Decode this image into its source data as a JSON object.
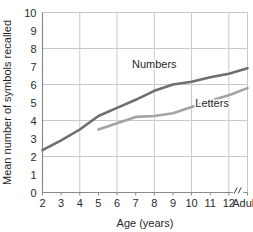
{
  "chart_data": {
    "type": "line",
    "title": "",
    "xlabel": "Age (years)",
    "ylabel": "Mean number of symbols recalled",
    "x_tick_labels": [
      "2",
      "3",
      "4",
      "5",
      "6",
      "7",
      "8",
      "9",
      "10",
      "11",
      "12",
      "Adults"
    ],
    "y_tick_labels": [
      "0",
      "1",
      "2",
      "3",
      "4",
      "5",
      "6",
      "7",
      "8",
      "9",
      "10"
    ],
    "ylim": [
      0,
      10
    ],
    "y_gridlines_at": [
      0,
      2,
      4,
      6,
      8,
      10
    ],
    "x_gridlines_at": [
      "2",
      "4",
      "6",
      "8",
      "10",
      "12",
      "Adults"
    ],
    "grid": true,
    "legend_position": "inline-annotation",
    "axis_break": {
      "symbol": "//",
      "between": [
        "12",
        "Adults"
      ]
    },
    "series": [
      {
        "name": "Numbers",
        "label": "Numbers",
        "color": "#6e6e6e",
        "x": [
          "2",
          "3",
          "4",
          "5",
          "6",
          "7",
          "8",
          "9",
          "10",
          "11",
          "12",
          "Adults"
        ],
        "values": [
          2.35,
          2.9,
          3.5,
          4.25,
          4.7,
          5.15,
          5.65,
          6.0,
          6.15,
          6.4,
          6.6,
          6.9
        ]
      },
      {
        "name": "Letters",
        "label": "Letters",
        "color": "#a3a3a3",
        "x": [
          "5",
          "6",
          "7",
          "8",
          "9",
          "10",
          "11",
          "12",
          "Adults"
        ],
        "values": [
          3.5,
          3.85,
          4.2,
          4.25,
          4.4,
          4.75,
          5.1,
          5.4,
          5.8
        ]
      }
    ],
    "annotations": [
      {
        "text": "Numbers",
        "x": "8.0",
        "y": 6.9
      },
      {
        "text": "Letters",
        "x": "11.1",
        "y": 4.75
      }
    ]
  }
}
